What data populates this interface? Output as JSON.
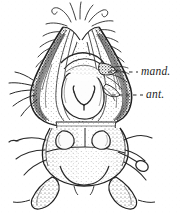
{
  "figure": {
    "kind": "scientific-line-engraving",
    "background_color": "#ffffff",
    "ink_color": "#1d1d1d",
    "width": 181,
    "height": 213
  },
  "labels": [
    {
      "id": "mand",
      "text": "mand.",
      "meaning": "mandible",
      "style": "italic-serif",
      "leader": "dashed",
      "leader_from_x": 108,
      "leader_to_x": 138,
      "leader_y": 72
    },
    {
      "id": "ant",
      "text": "ant.",
      "meaning": "antenna",
      "style": "italic-serif",
      "leader": "dashed",
      "leader_from_x": 112,
      "leader_to_x": 143,
      "leader_y": 95
    }
  ],
  "parts": {
    "apex_setae": "setae-tuft-apex",
    "left_lobe": "left-head-lobe",
    "right_lobe": "right-head-lobe",
    "median_oval": "median-pale-oval",
    "hypopharynx": "wishbone-hypopharynx",
    "thorax": "thorax-segment",
    "paired_patches": "paired-pale-patches",
    "club_palp": "club-shaped-palp",
    "left_appendages": "left-lateral-appendages",
    "right_appendages": "right-lateral-appendages",
    "posterior_lobes": "posterior-lobes"
  }
}
